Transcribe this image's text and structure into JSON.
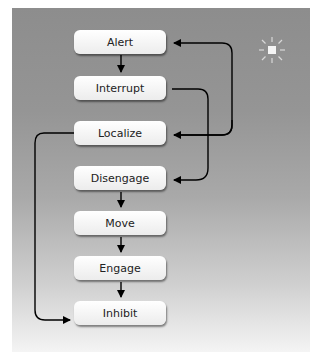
{
  "diagram": {
    "nodes": [
      {
        "id": "alert",
        "label": "Alert"
      },
      {
        "id": "interrupt",
        "label": "Interrupt"
      },
      {
        "id": "localize",
        "label": "Localize"
      },
      {
        "id": "disengage",
        "label": "Disengage"
      },
      {
        "id": "move",
        "label": "Move"
      },
      {
        "id": "engage",
        "label": "Engage"
      },
      {
        "id": "inhibit",
        "label": "Inhibit"
      }
    ],
    "edges": [
      {
        "from": "alert",
        "to": "interrupt"
      },
      {
        "from": "interrupt",
        "to": "disengage"
      },
      {
        "from": "localize",
        "to": "alert"
      },
      {
        "from": "localize",
        "to": "inhibit"
      },
      {
        "from": "disengage",
        "to": "move"
      },
      {
        "from": "move",
        "to": "engage"
      },
      {
        "from": "engage",
        "to": "inhibit"
      }
    ],
    "icon": "light-burst-icon",
    "colors": {
      "background_top": "#8d8d8d",
      "background_bottom": "#f4f4f4",
      "node_fill": "#ffffff",
      "arrow": "#000000"
    }
  }
}
